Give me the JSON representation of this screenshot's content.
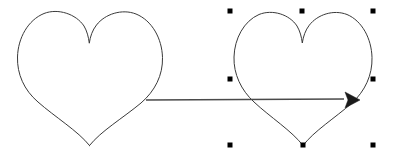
{
  "canvas": {
    "width": 393,
    "height": 158,
    "background_color": "#ffffff"
  },
  "shapes": [
    {
      "id": "heart-left",
      "name": "heart-shape-left",
      "selected": false,
      "stroke_color": "#3a3a3a",
      "fill": "none",
      "bounds": {
        "x": 17,
        "y": 11,
        "width": 146,
        "height": 135
      },
      "path": "M 89.5 145.5 C 78 131 55 117 38 102 C 24 90 17 74 17.5 57 C 18 38 28 20 44 13.5 C 58 8 76 14 84 26 C 87 31 88.5 37 89.3 43.2 C 90.2 36.5 92.5 30 96.5 25 C 105 14 122 8.5 136 14 C 152 20.5 162 38.5 162.5 57.5 C 163 75 155 91 141 103 C 123 118 101 131 89.5 145.5 Z"
    },
    {
      "id": "heart-right",
      "name": "heart-shape-right",
      "selected": true,
      "stroke_color": "#3a3a3a",
      "fill": "none",
      "bounds": {
        "x": 233,
        "y": 11,
        "width": 139,
        "height": 135
      },
      "path": "M 303 145.5 C 292 131 270 117 254 102 C 241 90 233.5 74 234 57 C 234.5 38.5 244 21 259 14.5 C 272.5 9 289.5 14.5 297 26 C 300 31 301.5 36.8 302.3 43 C 303.2 36.5 305.5 30 309.3 25.2 C 317.5 14.5 333.5 9.3 347 14.5 C 362 20.8 371.5 38.5 372 57.5 C 372.5 75 365 91 352 103 C 335 118 314 131 303 145.5 Z"
    }
  ],
  "connector": {
    "name": "arrow-connector",
    "type": "straight-arrow",
    "stroke_color": "#4a4a4a",
    "head_fill_color": "#1a1a1a",
    "start": {
      "x": 146,
      "y": 100
    },
    "end": {
      "x": 352,
      "y": 100
    },
    "line_end": {
      "x": 344,
      "y": 99
    },
    "head_points": "345,92 360,100 345,108 348,100"
  },
  "selection": {
    "target_shape_id": "heart-right",
    "handle_color": "#000000",
    "handle_size": 5,
    "handles": [
      {
        "name": "handle-top-left",
        "x": 230,
        "y": 11,
        "cursor": "nwse-resize"
      },
      {
        "name": "handle-top-center",
        "x": 302,
        "y": 11,
        "cursor": "ns-resize"
      },
      {
        "name": "handle-top-right",
        "x": 373,
        "y": 11,
        "cursor": "nesw-resize"
      },
      {
        "name": "handle-middle-left",
        "x": 230,
        "y": 79,
        "cursor": "ew-resize"
      },
      {
        "name": "handle-middle-right",
        "x": 373,
        "y": 79,
        "cursor": "ew-resize"
      },
      {
        "name": "handle-bottom-left",
        "x": 230,
        "y": 145,
        "cursor": "nesw-resize"
      },
      {
        "name": "handle-bottom-center",
        "x": 303,
        "y": 145,
        "cursor": "ns-resize"
      },
      {
        "name": "handle-bottom-right",
        "x": 373,
        "y": 145,
        "cursor": "nwse-resize"
      }
    ]
  }
}
